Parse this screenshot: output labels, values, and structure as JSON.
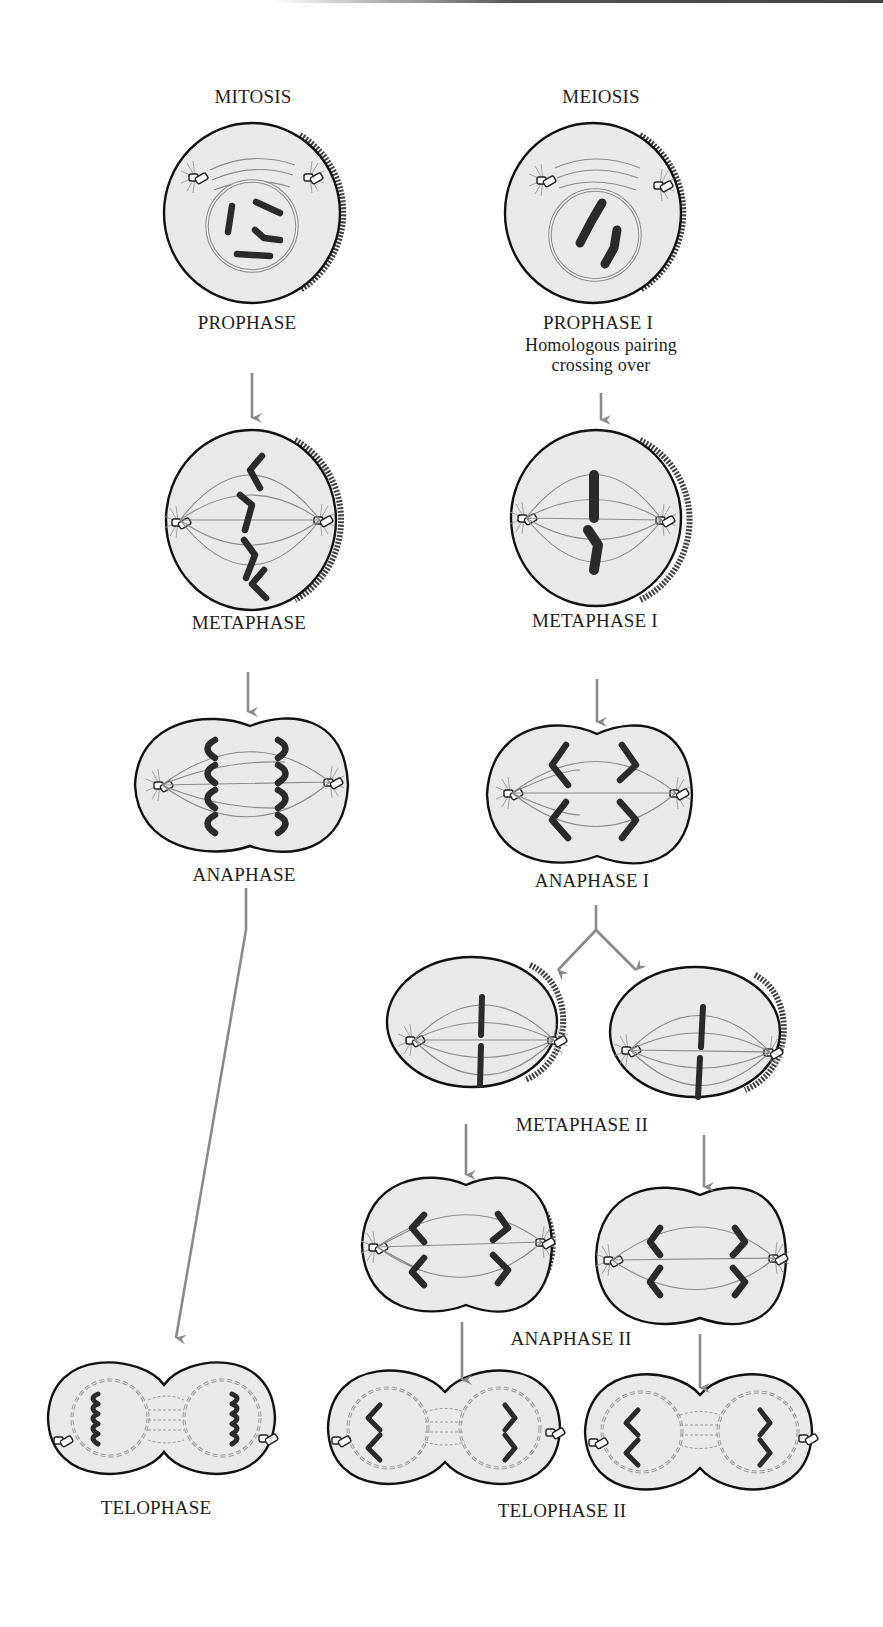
{
  "columns": {
    "mitosis": {
      "title": "MITOSIS"
    },
    "meiosis": {
      "title": "MEIOSIS"
    }
  },
  "mitosis": {
    "stages": [
      {
        "id": "prophase",
        "label": "PROPHASE"
      },
      {
        "id": "metaphase",
        "label": "METAPHASE"
      },
      {
        "id": "anaphase",
        "label": "ANAPHASE"
      },
      {
        "id": "telophase",
        "label": "TELOPHASE"
      }
    ]
  },
  "meiosis": {
    "stages": [
      {
        "id": "prophase-1",
        "label": "PROPHASE I",
        "note_line1": "Homologous pairing",
        "note_line2": "crossing over"
      },
      {
        "id": "metaphase-1",
        "label": "METAPHASE I"
      },
      {
        "id": "anaphase-1",
        "label": "ANAPHASE I"
      },
      {
        "id": "metaphase-2",
        "label": "METAPHASE II"
      },
      {
        "id": "anaphase-2",
        "label": "ANAPHASE II"
      },
      {
        "id": "telophase-2",
        "label": "TELOPHASE II"
      }
    ]
  },
  "colors": {
    "cell_fill": "#e9e9e9",
    "outline": "#111111",
    "arrow": "#8a8a8a",
    "chromosome": "#2a2a2a",
    "spindle": "#8a8a8a"
  }
}
